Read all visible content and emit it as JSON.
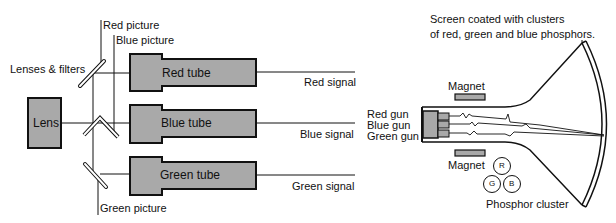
{
  "camera": {
    "lens_label": "Lens",
    "lenses_filters_label": "Lenses & filters",
    "red_picture_label": "Red picture",
    "blue_picture_label": "Blue picture",
    "green_picture_label": "Green picture",
    "tubes": [
      {
        "label": "Red tube",
        "signal": "Red signal"
      },
      {
        "label": "Blue tube",
        "signal": "Blue signal"
      },
      {
        "label": "Green tube",
        "signal": "Green signal"
      }
    ]
  },
  "receiver": {
    "screen_caption_line1": "Screen coated with clusters",
    "screen_caption_line2": "of red, green and blue phosphors.",
    "magnet_top": "Magnet",
    "magnet_bottom": "Magnet",
    "guns": [
      "Red gun",
      "Blue gun",
      "Green gun"
    ],
    "phosphor_cluster_label": "Phosphor cluster",
    "phosphors": [
      "R",
      "G",
      "B"
    ]
  },
  "colors": {
    "box_fill": "#a9a9a9",
    "stroke": "#111111"
  }
}
